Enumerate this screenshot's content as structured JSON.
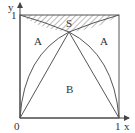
{
  "diagram": {
    "type": "geometry",
    "axes": {
      "x_label": "x",
      "y_label": "y",
      "origin_label": "0",
      "x_tick_label": "1",
      "y_tick_label": "1"
    },
    "regions": {
      "s_label": "S",
      "a_left_label": "A",
      "a_right_label": "A",
      "b_label": "B"
    },
    "colors": {
      "stroke": "#555555",
      "hatch": "#777777",
      "text": "#333333",
      "background": "#ffffff"
    }
  }
}
